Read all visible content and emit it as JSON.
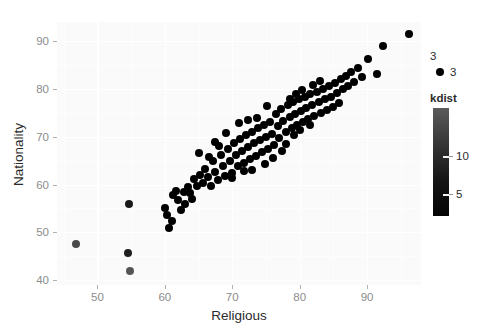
{
  "chart_data": {
    "type": "scatter",
    "title": "",
    "xlabel": "Religious",
    "ylabel": "Nationality",
    "xlim": [
      44,
      98
    ],
    "ylim": [
      39,
      94
    ],
    "xticks": [
      50,
      60,
      70,
      80,
      90
    ],
    "yticks": [
      40,
      50,
      60,
      70,
      80,
      90
    ],
    "grid": true,
    "grid_color": "#ffffff",
    "panel_background": "#fafafa",
    "point_color": "#000000",
    "point_size_px": 8,
    "legends": [
      {
        "name": "size-legend",
        "title": "3",
        "type": "discrete",
        "position": "right",
        "entries": [
          {
            "label": "3",
            "marker": "circle",
            "color": "#000000"
          }
        ]
      },
      {
        "name": "kdist-colorbar",
        "title": "kdist",
        "type": "colorbar",
        "position": "right",
        "ticks": [
          10,
          5
        ],
        "gradient_top_color": "#5b5b5b",
        "gradient_bottom_color": "#040404",
        "range_note": "light (high) at top to dark (low) at bottom"
      }
    ],
    "points": [
      {
        "x": 46.8,
        "y": 47.6,
        "color": "#4a4a4a"
      },
      {
        "x": 54.7,
        "y": 56.0,
        "color": "#1a1a1a"
      },
      {
        "x": 54.6,
        "y": 45.6,
        "color": "#1f1f1f"
      },
      {
        "x": 54.9,
        "y": 42.0,
        "color": "#555555"
      },
      {
        "x": 60.0,
        "y": 55.2,
        "color": "#000000"
      },
      {
        "x": 60.3,
        "y": 53.6,
        "color": "#000000"
      },
      {
        "x": 60.6,
        "y": 51.0,
        "color": "#000000"
      },
      {
        "x": 61.2,
        "y": 57.8,
        "color": "#000000"
      },
      {
        "x": 61.6,
        "y": 58.6,
        "color": "#000000"
      },
      {
        "x": 62.0,
        "y": 56.7,
        "color": "#000000"
      },
      {
        "x": 62.8,
        "y": 58.5,
        "color": "#000000"
      },
      {
        "x": 63.4,
        "y": 59.4,
        "color": "#000000"
      },
      {
        "x": 63.8,
        "y": 58.2,
        "color": "#000000"
      },
      {
        "x": 64.3,
        "y": 61.1,
        "color": "#000000"
      },
      {
        "x": 64.7,
        "y": 59.8,
        "color": "#000000"
      },
      {
        "x": 65.2,
        "y": 62.0,
        "color": "#000000"
      },
      {
        "x": 65.6,
        "y": 60.4,
        "color": "#000000"
      },
      {
        "x": 66.0,
        "y": 63.3,
        "color": "#000000"
      },
      {
        "x": 66.4,
        "y": 61.6,
        "color": "#000000"
      },
      {
        "x": 66.8,
        "y": 59.6,
        "color": "#000000"
      },
      {
        "x": 67.1,
        "y": 64.9,
        "color": "#000000"
      },
      {
        "x": 67.5,
        "y": 62.6,
        "color": "#000000"
      },
      {
        "x": 67.9,
        "y": 60.9,
        "color": "#000000"
      },
      {
        "x": 68.3,
        "y": 66.1,
        "color": "#000000"
      },
      {
        "x": 68.6,
        "y": 63.8,
        "color": "#000000"
      },
      {
        "x": 68.9,
        "y": 61.8,
        "color": "#000000"
      },
      {
        "x": 69.3,
        "y": 67.4,
        "color": "#000000"
      },
      {
        "x": 69.6,
        "y": 65.0,
        "color": "#000000"
      },
      {
        "x": 69.9,
        "y": 62.4,
        "color": "#000000"
      },
      {
        "x": 70.2,
        "y": 68.7,
        "color": "#000000"
      },
      {
        "x": 70.5,
        "y": 66.2,
        "color": "#000000"
      },
      {
        "x": 70.8,
        "y": 63.9,
        "color": "#000000"
      },
      {
        "x": 71.1,
        "y": 69.6,
        "color": "#000000"
      },
      {
        "x": 71.4,
        "y": 67.0,
        "color": "#000000"
      },
      {
        "x": 71.7,
        "y": 64.6,
        "color": "#000000"
      },
      {
        "x": 72.0,
        "y": 70.4,
        "color": "#000000"
      },
      {
        "x": 72.3,
        "y": 67.8,
        "color": "#000000"
      },
      {
        "x": 72.6,
        "y": 65.3,
        "color": "#000000"
      },
      {
        "x": 72.9,
        "y": 71.1,
        "color": "#000000"
      },
      {
        "x": 73.2,
        "y": 68.6,
        "color": "#000000"
      },
      {
        "x": 73.5,
        "y": 66.0,
        "color": "#000000"
      },
      {
        "x": 73.8,
        "y": 71.8,
        "color": "#000000"
      },
      {
        "x": 74.1,
        "y": 69.3,
        "color": "#000000"
      },
      {
        "x": 74.4,
        "y": 66.8,
        "color": "#000000"
      },
      {
        "x": 74.7,
        "y": 72.4,
        "color": "#000000"
      },
      {
        "x": 75.0,
        "y": 70.0,
        "color": "#000000"
      },
      {
        "x": 75.3,
        "y": 67.5,
        "color": "#000000"
      },
      {
        "x": 75.6,
        "y": 73.0,
        "color": "#000000"
      },
      {
        "x": 75.9,
        "y": 70.6,
        "color": "#000000"
      },
      {
        "x": 76.2,
        "y": 68.2,
        "color": "#000000"
      },
      {
        "x": 76.5,
        "y": 74.7,
        "color": "#000000"
      },
      {
        "x": 76.8,
        "y": 72.2,
        "color": "#000000"
      },
      {
        "x": 77.0,
        "y": 69.8,
        "color": "#000000"
      },
      {
        "x": 77.3,
        "y": 75.8,
        "color": "#000000"
      },
      {
        "x": 77.6,
        "y": 73.4,
        "color": "#000000"
      },
      {
        "x": 77.9,
        "y": 71.0,
        "color": "#000000"
      },
      {
        "x": 78.2,
        "y": 76.6,
        "color": "#000000"
      },
      {
        "x": 78.5,
        "y": 74.2,
        "color": "#000000"
      },
      {
        "x": 78.8,
        "y": 71.9,
        "color": "#000000"
      },
      {
        "x": 79.0,
        "y": 77.2,
        "color": "#000000"
      },
      {
        "x": 79.3,
        "y": 74.8,
        "color": "#000000"
      },
      {
        "x": 79.6,
        "y": 72.5,
        "color": "#000000"
      },
      {
        "x": 79.9,
        "y": 77.8,
        "color": "#000000"
      },
      {
        "x": 80.2,
        "y": 75.4,
        "color": "#000000"
      },
      {
        "x": 80.5,
        "y": 73.1,
        "color": "#000000"
      },
      {
        "x": 80.8,
        "y": 78.4,
        "color": "#000000"
      },
      {
        "x": 81.0,
        "y": 76.0,
        "color": "#000000"
      },
      {
        "x": 81.3,
        "y": 73.7,
        "color": "#000000"
      },
      {
        "x": 81.6,
        "y": 78.9,
        "color": "#000000"
      },
      {
        "x": 81.9,
        "y": 76.6,
        "color": "#000000"
      },
      {
        "x": 82.2,
        "y": 74.3,
        "color": "#000000"
      },
      {
        "x": 82.5,
        "y": 79.4,
        "color": "#000000"
      },
      {
        "x": 82.8,
        "y": 77.2,
        "color": "#000000"
      },
      {
        "x": 83.1,
        "y": 74.9,
        "color": "#000000"
      },
      {
        "x": 83.4,
        "y": 79.9,
        "color": "#000000"
      },
      {
        "x": 83.7,
        "y": 77.8,
        "color": "#000000"
      },
      {
        "x": 84.0,
        "y": 75.6,
        "color": "#000000"
      },
      {
        "x": 84.3,
        "y": 80.6,
        "color": "#000000"
      },
      {
        "x": 84.6,
        "y": 78.4,
        "color": "#000000"
      },
      {
        "x": 84.9,
        "y": 76.3,
        "color": "#000000"
      },
      {
        "x": 85.2,
        "y": 81.3,
        "color": "#000000"
      },
      {
        "x": 85.5,
        "y": 79.2,
        "color": "#000000"
      },
      {
        "x": 85.8,
        "y": 77.0,
        "color": "#000000"
      },
      {
        "x": 86.1,
        "y": 82.0,
        "color": "#000000"
      },
      {
        "x": 86.4,
        "y": 79.9,
        "color": "#000000"
      },
      {
        "x": 86.8,
        "y": 82.8,
        "color": "#000000"
      },
      {
        "x": 87.2,
        "y": 80.7,
        "color": "#000000"
      },
      {
        "x": 87.6,
        "y": 83.6,
        "color": "#000000"
      },
      {
        "x": 88.1,
        "y": 81.5,
        "color": "#000000"
      },
      {
        "x": 88.6,
        "y": 84.4,
        "color": "#000000"
      },
      {
        "x": 89.3,
        "y": 82.4,
        "color": "#000000"
      },
      {
        "x": 90.2,
        "y": 86.2,
        "color": "#000000"
      },
      {
        "x": 91.4,
        "y": 83.1,
        "color": "#000000"
      },
      {
        "x": 92.4,
        "y": 88.9,
        "color": "#000000"
      },
      {
        "x": 96.2,
        "y": 91.5,
        "color": "#000000"
      },
      {
        "x": 64.0,
        "y": 57.0,
        "color": "#000000"
      },
      {
        "x": 66.6,
        "y": 65.8,
        "color": "#000000"
      },
      {
        "x": 68.0,
        "y": 68.0,
        "color": "#000000"
      },
      {
        "x": 70.0,
        "y": 61.4,
        "color": "#000000"
      },
      {
        "x": 71.8,
        "y": 62.8,
        "color": "#000000"
      },
      {
        "x": 73.0,
        "y": 63.0,
        "color": "#000000"
      },
      {
        "x": 74.9,
        "y": 64.4,
        "color": "#000000"
      },
      {
        "x": 76.0,
        "y": 65.6,
        "color": "#000000"
      },
      {
        "x": 77.4,
        "y": 67.0,
        "color": "#000000"
      },
      {
        "x": 78.0,
        "y": 68.5,
        "color": "#000000"
      },
      {
        "x": 79.2,
        "y": 70.4,
        "color": "#000000"
      },
      {
        "x": 80.0,
        "y": 71.5,
        "color": "#000000"
      },
      {
        "x": 81.5,
        "y": 72.4,
        "color": "#000000"
      },
      {
        "x": 82.0,
        "y": 80.9,
        "color": "#000000"
      },
      {
        "x": 83.0,
        "y": 81.6,
        "color": "#000000"
      },
      {
        "x": 80.4,
        "y": 79.7,
        "color": "#000000"
      },
      {
        "x": 79.5,
        "y": 79.0,
        "color": "#000000"
      },
      {
        "x": 78.6,
        "y": 78.0,
        "color": "#000000"
      },
      {
        "x": 75.2,
        "y": 76.4,
        "color": "#000000"
      },
      {
        "x": 73.6,
        "y": 74.0,
        "color": "#000000"
      },
      {
        "x": 72.4,
        "y": 73.6,
        "color": "#000000"
      },
      {
        "x": 71.0,
        "y": 72.8,
        "color": "#000000"
      },
      {
        "x": 69.0,
        "y": 70.8,
        "color": "#000000"
      },
      {
        "x": 67.4,
        "y": 68.9,
        "color": "#000000"
      },
      {
        "x": 65.0,
        "y": 66.6,
        "color": "#000000"
      },
      {
        "x": 62.4,
        "y": 54.7,
        "color": "#000000"
      },
      {
        "x": 61.0,
        "y": 52.4,
        "color": "#000000"
      },
      {
        "x": 63.0,
        "y": 56.0,
        "color": "#000000"
      }
    ]
  }
}
